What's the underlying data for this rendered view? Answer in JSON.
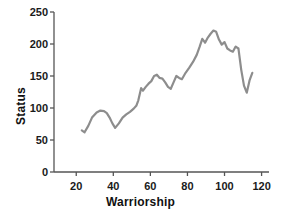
{
  "chart_data": {
    "type": "line",
    "title": "",
    "xlabel": "Warriorship",
    "ylabel": "Status",
    "xlim": [
      8,
      124
    ],
    "ylim": [
      0,
      250
    ],
    "xticks": [
      20,
      40,
      60,
      80,
      100,
      120
    ],
    "yticks": [
      0,
      50,
      100,
      150,
      200,
      250
    ],
    "grid": false,
    "legend": null,
    "line_color": "#8d8d8d",
    "line_width": 2.2,
    "axis_color": "#555555",
    "series": [
      {
        "name": "status-vs-warriorship",
        "x": [
          23.0,
          24.5,
          26.5,
          28.5,
          31.0,
          33.0,
          35.0,
          36.5,
          38.0,
          39.5,
          41.0,
          43.0,
          45.0,
          47.0,
          49.0,
          51.0,
          52.5,
          53.5,
          55.0,
          56.0,
          57.5,
          59.0,
          60.5,
          62.0,
          63.5,
          65.0,
          66.5,
          68.0,
          69.5,
          71.0,
          72.5,
          74.0,
          75.5,
          77.0,
          79.0,
          81.0,
          83.0,
          85.0,
          86.5,
          88.0,
          89.5,
          91.0,
          92.5,
          94.0,
          95.5,
          97.0,
          98.5,
          100.0,
          101.5,
          103.0,
          104.5,
          106.0,
          107.5,
          109.0,
          110.5,
          112.0,
          113.5,
          115.0
        ],
        "y": [
          65.0,
          62.0,
          72.0,
          85.0,
          93.0,
          96.0,
          95.0,
          92.0,
          85.0,
          76.0,
          69.0,
          76.0,
          85.0,
          90.0,
          94.0,
          99.0,
          104.0,
          112.0,
          131.0,
          127.0,
          133.0,
          138.0,
          142.0,
          150.0,
          152.0,
          147.0,
          146.0,
          140.0,
          133.0,
          130.0,
          140.0,
          150.0,
          147.0,
          145.0,
          155.0,
          163.0,
          172.0,
          183.0,
          195.0,
          208.0,
          202.0,
          210.0,
          216.0,
          221.0,
          219.0,
          207.0,
          199.0,
          203.0,
          193.0,
          190.0,
          188.0,
          196.0,
          193.0,
          160.0,
          135.0,
          124.0,
          143.0,
          155.0
        ]
      }
    ]
  },
  "axes": {
    "y_tick_labels": [
      "0",
      "50",
      "100",
      "150",
      "200",
      "250"
    ],
    "x_tick_labels": [
      "20",
      "40",
      "60",
      "80",
      "100",
      "120"
    ],
    "x_title": "Warriorship",
    "y_title": "Status"
  }
}
